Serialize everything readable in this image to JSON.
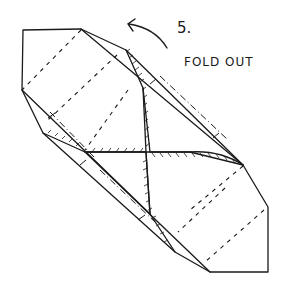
{
  "diagram": {
    "step_number": "5.",
    "instruction": "FOLD OUT",
    "arrow_semantic": "curved-arrow-fold-out",
    "colors": {
      "ink": "#1a1a1a",
      "background": "#ffffff"
    }
  }
}
